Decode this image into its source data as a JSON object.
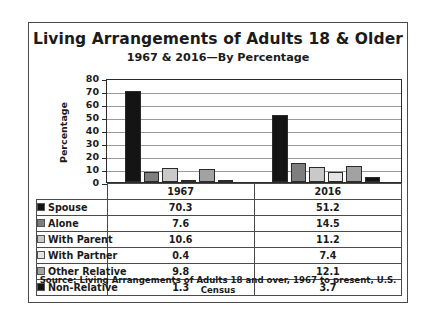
{
  "chart_data": {
    "type": "bar",
    "title": "Living Arrangements of Adults 18 & Older",
    "subtitle": "1967 & 2016—By Percentage",
    "xlabel": "",
    "ylabel": "Percentage",
    "ylim": [
      0,
      80
    ],
    "yticks": [
      0,
      10,
      20,
      30,
      40,
      50,
      60,
      70,
      80
    ],
    "grid": true,
    "legend_position": "table-below",
    "categories": [
      "1967",
      "2016"
    ],
    "series": [
      {
        "name": "Spouse",
        "values": [
          70.3,
          51.2
        ],
        "color": "#141414"
      },
      {
        "name": "Alone",
        "values": [
          7.6,
          14.5
        ],
        "color": "#7e7e7e"
      },
      {
        "name": "With Parent",
        "values": [
          10.6,
          11.2
        ],
        "color": "#c9c9c9"
      },
      {
        "name": "With Partner",
        "values": [
          0.4,
          7.4
        ],
        "color": "#e4e4e4"
      },
      {
        "name": "Other Relative",
        "values": [
          9.8,
          12.1
        ],
        "color": "#a2a2a2"
      },
      {
        "name": "Non-Relative",
        "values": [
          1.3,
          3.7
        ],
        "color": "#141414"
      }
    ],
    "source": "Source: Living Arrangements of Adults 18 and over, 1967 to present, U.S. Census"
  },
  "table": {
    "corner": "",
    "columns": [
      "1967",
      "2016"
    ],
    "rows": [
      {
        "label": "Spouse",
        "v1967": "70.3",
        "v2016": "51.2"
      },
      {
        "label": "Alone",
        "v1967": "7.6",
        "v2016": "14.5"
      },
      {
        "label": "With Parent",
        "v1967": "10.6",
        "v2016": "11.2"
      },
      {
        "label": "With Partner",
        "v1967": "0.4",
        "v2016": "7.4"
      },
      {
        "label": "Other Relative",
        "v1967": "9.8",
        "v2016": "12.1"
      },
      {
        "label": "Non-Relative",
        "v1967": "1.3",
        "v2016": "3.7"
      }
    ]
  }
}
